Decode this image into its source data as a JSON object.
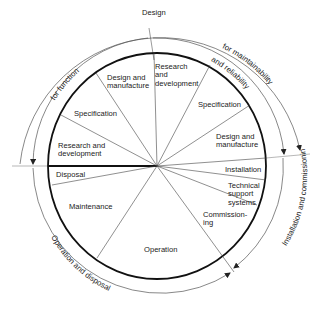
{
  "diagram": {
    "type": "life-cycle circle",
    "outer_labels": {
      "design": "Design",
      "for_function": "for function",
      "for_maintainability": "for maintainability",
      "and_reliability": "and reliability",
      "installation_and_commissioning": "Installation and commissioning",
      "operation_and_disposal": "Operation and disposal"
    },
    "segments": [
      {
        "id": "research-development-top",
        "label_line1": "Research",
        "label_line2": "and",
        "label_line3": "development"
      },
      {
        "id": "specification-right",
        "label": "Specification"
      },
      {
        "id": "design-manufacture-right",
        "label_line1": "Design and",
        "label_line2": "manufacture"
      },
      {
        "id": "installation",
        "label": "Installation"
      },
      {
        "id": "technical-support",
        "label_line1": "Technical",
        "label_line2": "support",
        "label_line3": "systems"
      },
      {
        "id": "commissioning",
        "label_line1": "Commission-",
        "label_line2": "ing"
      },
      {
        "id": "operation",
        "label": "Operation"
      },
      {
        "id": "maintenance",
        "label": "Maintenance"
      },
      {
        "id": "disposal",
        "label": "Disposal"
      },
      {
        "id": "research-development-left",
        "label_line1": "Research and",
        "label_line2": "development"
      },
      {
        "id": "specification-left",
        "label": "Specification"
      },
      {
        "id": "design-manufacture-left",
        "label_line1": "Design and",
        "label_line2": "manufacture"
      }
    ],
    "colors": {
      "line": "#222222",
      "background": "#ffffff"
    }
  }
}
